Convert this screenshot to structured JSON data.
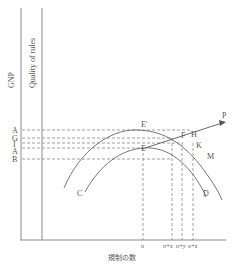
{
  "diagram": {
    "axes": {
      "y_label_left": "GNP",
      "y_label_inner": "Quality of rules",
      "x_label": "規制の数"
    },
    "y_levels": [
      {
        "label": "A",
        "y": 130
      },
      {
        "label": "G",
        "y": 138
      },
      {
        "label": "I",
        "y": 143
      },
      {
        "label": "A",
        "y": 148
      },
      {
        "label": "B",
        "y": 159
      }
    ],
    "x_ticks": [
      {
        "label": "n",
        "x": 143
      },
      {
        "label": "n+x",
        "x": 172
      },
      {
        "label": "n+y",
        "x": 183
      },
      {
        "label": "n+z",
        "x": 193
      }
    ],
    "points": {
      "E_prime": "E'",
      "E": "E",
      "F": "F",
      "H": "H",
      "K": "K",
      "M": "M",
      "P": "P",
      "C": "C",
      "D": "D"
    },
    "colors": {
      "line": "#666666",
      "axis": "#8a8a8a",
      "text": "#555555"
    }
  }
}
